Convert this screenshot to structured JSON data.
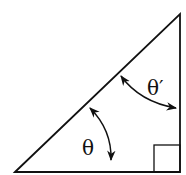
{
  "diagram": {
    "type": "right-triangle",
    "labels": {
      "theta": "θ",
      "theta_prime": "θ′"
    },
    "right_angle_marker": true,
    "colors": {
      "stroke": "#111111",
      "background": "#ffffff"
    }
  }
}
